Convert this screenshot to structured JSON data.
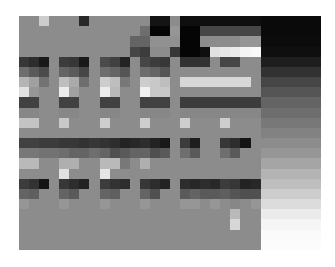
{
  "image": {
    "description": "Low-resolution pixelated grayscale image",
    "columns": 30,
    "rows": 23,
    "pixels": [
      [
        140,
        140,
        205,
        140,
        140,
        140,
        40,
        140,
        140,
        140,
        140,
        140,
        140,
        20,
        20,
        140,
        15,
        15,
        15,
        15,
        15,
        15,
        15,
        15,
        10,
        10,
        10,
        10,
        10,
        10
      ],
      [
        140,
        140,
        140,
        140,
        140,
        140,
        140,
        140,
        140,
        140,
        140,
        140,
        110,
        5,
        5,
        150,
        5,
        5,
        70,
        70,
        70,
        70,
        70,
        70,
        10,
        10,
        10,
        10,
        10,
        10
      ],
      [
        140,
        140,
        140,
        140,
        140,
        140,
        140,
        140,
        140,
        140,
        140,
        100,
        100,
        145,
        145,
        145,
        5,
        5,
        140,
        140,
        140,
        140,
        150,
        150,
        12,
        12,
        12,
        12,
        12,
        12
      ],
      [
        140,
        140,
        140,
        140,
        140,
        140,
        140,
        140,
        140,
        140,
        140,
        70,
        60,
        140,
        140,
        55,
        5,
        5,
        15,
        225,
        230,
        235,
        245,
        250,
        15,
        15,
        15,
        15,
        15,
        15
      ],
      [
        55,
        45,
        25,
        140,
        60,
        55,
        25,
        140,
        75,
        65,
        35,
        140,
        70,
        60,
        55,
        140,
        50,
        50,
        50,
        140,
        70,
        70,
        140,
        140,
        30,
        30,
        30,
        30,
        30,
        30
      ],
      [
        110,
        90,
        75,
        140,
        100,
        90,
        70,
        140,
        110,
        100,
        85,
        140,
        110,
        100,
        85,
        140,
        140,
        140,
        140,
        140,
        140,
        140,
        140,
        140,
        50,
        50,
        50,
        50,
        50,
        50
      ],
      [
        180,
        160,
        115,
        140,
        190,
        170,
        110,
        140,
        205,
        190,
        120,
        140,
        205,
        200,
        190,
        140,
        215,
        215,
        215,
        215,
        215,
        215,
        215,
        140,
        70,
        70,
        70,
        70,
        70,
        70
      ],
      [
        225,
        150,
        140,
        140,
        235,
        160,
        140,
        140,
        235,
        185,
        140,
        140,
        240,
        200,
        200,
        140,
        140,
        140,
        140,
        140,
        140,
        140,
        140,
        140,
        85,
        85,
        85,
        85,
        85,
        85
      ],
      [
        65,
        65,
        140,
        140,
        65,
        65,
        140,
        140,
        65,
        65,
        140,
        140,
        65,
        65,
        65,
        140,
        60,
        60,
        60,
        60,
        60,
        60,
        60,
        60,
        100,
        100,
        100,
        100,
        100,
        100
      ],
      [
        135,
        135,
        140,
        140,
        135,
        135,
        140,
        140,
        135,
        135,
        140,
        140,
        135,
        135,
        135,
        140,
        135,
        135,
        135,
        135,
        135,
        135,
        135,
        135,
        110,
        110,
        110,
        110,
        110,
        110
      ],
      [
        195,
        195,
        140,
        140,
        200,
        140,
        140,
        140,
        205,
        140,
        140,
        140,
        205,
        140,
        140,
        140,
        205,
        140,
        140,
        140,
        205,
        140,
        140,
        140,
        120,
        120,
        120,
        120,
        120,
        120
      ],
      [
        140,
        140,
        140,
        140,
        140,
        140,
        140,
        140,
        140,
        140,
        140,
        140,
        140,
        140,
        140,
        140,
        140,
        140,
        140,
        140,
        140,
        140,
        140,
        140,
        130,
        130,
        130,
        130,
        130,
        130
      ],
      [
        65,
        65,
        60,
        60,
        55,
        55,
        50,
        55,
        50,
        45,
        35,
        40,
        45,
        35,
        25,
        140,
        60,
        30,
        140,
        140,
        55,
        45,
        20,
        140,
        140,
        140,
        140,
        140,
        140,
        140
      ],
      [
        120,
        120,
        115,
        115,
        110,
        100,
        100,
        110,
        100,
        80,
        90,
        100,
        100,
        80,
        90,
        140,
        110,
        90,
        140,
        140,
        110,
        90,
        140,
        140,
        150,
        150,
        150,
        150,
        150,
        150
      ],
      [
        185,
        185,
        140,
        140,
        175,
        175,
        140,
        140,
        185,
        185,
        120,
        140,
        175,
        140,
        140,
        140,
        140,
        140,
        140,
        140,
        140,
        140,
        140,
        140,
        165,
        165,
        165,
        165,
        165,
        165
      ],
      [
        140,
        140,
        140,
        140,
        225,
        140,
        140,
        140,
        230,
        140,
        140,
        140,
        140,
        140,
        140,
        140,
        140,
        140,
        140,
        140,
        140,
        140,
        140,
        140,
        180,
        180,
        180,
        180,
        180,
        180
      ],
      [
        60,
        50,
        20,
        140,
        55,
        45,
        35,
        140,
        60,
        50,
        45,
        140,
        55,
        45,
        35,
        140,
        45,
        40,
        45,
        40,
        60,
        55,
        35,
        40,
        190,
        190,
        190,
        190,
        190,
        190
      ],
      [
        100,
        95,
        140,
        140,
        100,
        90,
        140,
        140,
        100,
        95,
        140,
        140,
        100,
        80,
        140,
        140,
        90,
        100,
        90,
        90,
        95,
        85,
        80,
        80,
        205,
        205,
        205,
        205,
        205,
        205
      ],
      [
        150,
        140,
        140,
        140,
        150,
        140,
        140,
        140,
        150,
        140,
        140,
        140,
        150,
        140,
        140,
        140,
        150,
        150,
        140,
        150,
        140,
        135,
        140,
        150,
        220,
        220,
        220,
        220,
        220,
        220
      ],
      [
        140,
        140,
        140,
        140,
        140,
        140,
        140,
        140,
        140,
        140,
        140,
        140,
        140,
        140,
        140,
        140,
        140,
        140,
        140,
        140,
        140,
        185,
        140,
        140,
        235,
        235,
        235,
        235,
        235,
        235
      ],
      [
        140,
        140,
        140,
        140,
        140,
        140,
        140,
        140,
        140,
        140,
        140,
        140,
        140,
        140,
        140,
        140,
        140,
        140,
        140,
        140,
        140,
        215,
        140,
        140,
        245,
        245,
        245,
        245,
        245,
        245
      ],
      [
        140,
        140,
        140,
        140,
        140,
        140,
        140,
        140,
        140,
        140,
        140,
        140,
        140,
        140,
        140,
        140,
        140,
        140,
        140,
        140,
        140,
        140,
        140,
        140,
        250,
        250,
        250,
        250,
        250,
        250
      ],
      [
        140,
        140,
        140,
        140,
        140,
        140,
        140,
        140,
        140,
        140,
        140,
        140,
        140,
        140,
        140,
        140,
        140,
        140,
        140,
        140,
        140,
        140,
        140,
        140,
        252,
        252,
        252,
        252,
        252,
        252
      ]
    ]
  }
}
